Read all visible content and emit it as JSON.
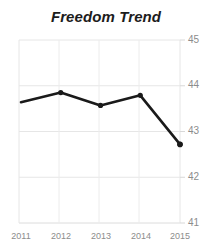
{
  "chart_data": {
    "type": "line",
    "title": "Freedom Trend",
    "xlabel": "",
    "ylabel": "",
    "categories": [
      "2011",
      "2012",
      "2013",
      "2014",
      "2015"
    ],
    "x": [
      2011,
      2012,
      2013,
      2014,
      2015
    ],
    "values": [
      43.64,
      43.85,
      43.57,
      43.79,
      42.72
    ],
    "series": [
      {
        "name": "Freedom Trend",
        "values": [
          43.64,
          43.85,
          43.57,
          43.79,
          42.72
        ],
        "color": "#1a1a1a",
        "marker": "circle",
        "line_width": 2.6
      }
    ],
    "ylim": [
      41,
      45
    ],
    "yticks": [
      41,
      42,
      43,
      44,
      45
    ],
    "ytick_labels": [
      "41",
      "42",
      "43",
      "44",
      "45"
    ],
    "xticks": [
      2011,
      2012,
      2013,
      2014,
      2015
    ],
    "xtick_labels": [
      "2011",
      "2012",
      "2013",
      "2014",
      "2015"
    ],
    "grid": true,
    "grid_color": "#e3e3e3",
    "y_axis_side": "right",
    "legend": false,
    "legend_position": "none",
    "background": "#ffffff",
    "title_color": "#1c1c1c",
    "tick_label_color": "#8c8c8c"
  },
  "axis": {
    "y_labels": [
      "45",
      "44",
      "43",
      "42",
      "41"
    ],
    "x_labels": [
      "2011",
      "2012",
      "2013",
      "2014",
      "2015"
    ]
  }
}
